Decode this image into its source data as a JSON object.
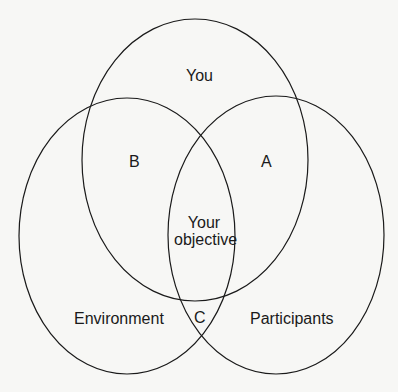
{
  "diagram": {
    "type": "venn",
    "stroke_color": "#1a1a1a",
    "background": "#f7f7f5",
    "sets": [
      {
        "id": "you",
        "label": "You"
      },
      {
        "id": "environment",
        "label": "Environment"
      },
      {
        "id": "participants",
        "label": "Participants"
      }
    ],
    "regions": {
      "a": "A",
      "b": "B",
      "c": "C",
      "center_line1": "Your",
      "center_line2": "objective"
    }
  }
}
